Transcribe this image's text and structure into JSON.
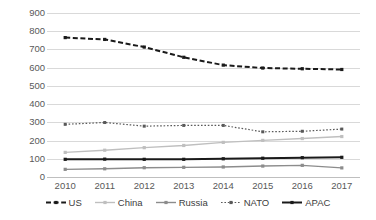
{
  "chart_data": {
    "type": "line",
    "title": "",
    "subtitle": "",
    "xlabel": "",
    "ylabel": "",
    "categories": [
      "2010",
      "2011",
      "2012",
      "2013",
      "2014",
      "2015",
      "2016",
      "2017"
    ],
    "x": [
      2010,
      2011,
      2012,
      2013,
      2014,
      2015,
      2016,
      2017
    ],
    "ylim": [
      0,
      900
    ],
    "yticks": [
      0,
      100,
      200,
      300,
      400,
      500,
      600,
      700,
      800,
      900
    ],
    "ytick_labels": [
      "0",
      "100",
      "200",
      "300",
      "400",
      "500",
      "600",
      "700",
      "800",
      "900"
    ],
    "grid": true,
    "grid_axis": "y",
    "legend_position": "bottom",
    "series": [
      {
        "name": "US",
        "values": [
          765,
          755,
          713,
          657,
          614,
          598,
          594,
          590
        ],
        "color": "#1a1a1a",
        "line_style": "dashed",
        "line_width": 2,
        "marker": "square"
      },
      {
        "name": "China",
        "values": [
          135,
          147,
          161,
          173,
          190,
          201,
          211,
          222
        ],
        "color": "#bfbfbf",
        "line_style": "solid",
        "line_width": 1.4,
        "marker": "square"
      },
      {
        "name": "Russia",
        "values": [
          42,
          45,
          51,
          53,
          55,
          60,
          64,
          50
        ],
        "color": "#8c8c8c",
        "line_style": "solid",
        "line_width": 1.4,
        "marker": "square"
      },
      {
        "name": "NATO",
        "values": [
          289,
          299,
          279,
          283,
          283,
          248,
          251,
          263
        ],
        "color": "#595959",
        "line_style": "dotted",
        "line_width": 1.2,
        "marker": "square"
      },
      {
        "name": "APAC",
        "values": [
          97,
          98,
          97,
          97,
          100,
          103,
          106,
          108
        ],
        "color": "#1a1a1a",
        "line_style": "solid",
        "line_width": 2,
        "marker": "square"
      }
    ]
  },
  "legend": {
    "items": [
      {
        "label": "US"
      },
      {
        "label": "China"
      },
      {
        "label": "Russia"
      },
      {
        "label": "NATO"
      },
      {
        "label": "APAC"
      }
    ]
  }
}
